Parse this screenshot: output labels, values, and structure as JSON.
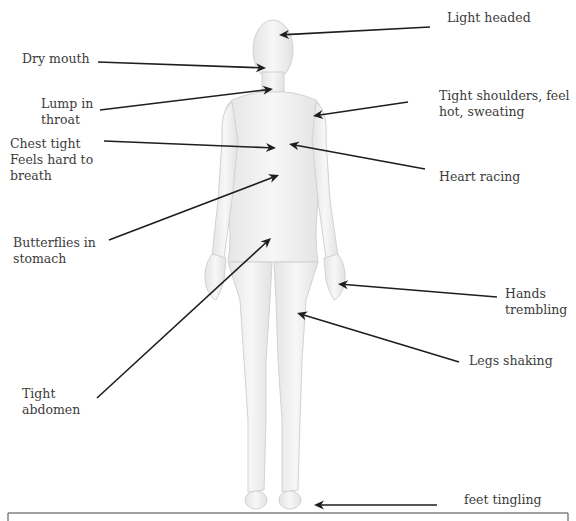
{
  "diagram": {
    "colors": {
      "arrow": "#1e1e1e",
      "text": "#3c3c3c",
      "body_fill": "#efefef",
      "body_stroke": "#cfcfcf",
      "frame": "#444444"
    },
    "labels": [
      {
        "id": "light-headed",
        "text": "Light headed",
        "x": 447,
        "y": 10
      },
      {
        "id": "dry-mouth",
        "text": "Dry mouth",
        "x": 22,
        "y": 51
      },
      {
        "id": "lump-in-throat",
        "text": "Lump in\nthroat",
        "x": 41,
        "y": 96
      },
      {
        "id": "tight-shoulders",
        "text": "Tight shoulders, feel\nhot, sweating",
        "x": 439,
        "y": 88
      },
      {
        "id": "chest-tight",
        "text": "Chest tight\nFeels hard to\nbreath",
        "x": 10,
        "y": 136
      },
      {
        "id": "heart-racing",
        "text": "Heart racing",
        "x": 439,
        "y": 169
      },
      {
        "id": "butterflies",
        "text": "Butterflies in\nstomach",
        "x": 13,
        "y": 235
      },
      {
        "id": "hands-trembling",
        "text": "Hands\ntrembling",
        "x": 505,
        "y": 286
      },
      {
        "id": "legs-shaking",
        "text": "Legs shaking",
        "x": 469,
        "y": 353
      },
      {
        "id": "tight-abdomen",
        "text": "Tight\nabdomen",
        "x": 22,
        "y": 386
      },
      {
        "id": "feet-tingling",
        "text": "feet tingling",
        "x": 464,
        "y": 492
      }
    ],
    "arrows": [
      {
        "id": "light-headed",
        "x1": 430,
        "y1": 27,
        "x2": 279,
        "y2": 35
      },
      {
        "id": "dry-mouth",
        "x1": 98,
        "y1": 62,
        "x2": 266,
        "y2": 68
      },
      {
        "id": "lump-in-throat",
        "x1": 100,
        "y1": 110,
        "x2": 273,
        "y2": 89
      },
      {
        "id": "tight-shoulders",
        "x1": 408,
        "y1": 102,
        "x2": 313,
        "y2": 116
      },
      {
        "id": "chest-tight",
        "x1": 104,
        "y1": 141,
        "x2": 276,
        "y2": 148
      },
      {
        "id": "heart-racing",
        "x1": 425,
        "y1": 169,
        "x2": 289,
        "y2": 144
      },
      {
        "id": "butterflies",
        "x1": 109,
        "y1": 240,
        "x2": 279,
        "y2": 175
      },
      {
        "id": "tight-abdomen",
        "x1": 97,
        "y1": 398,
        "x2": 271,
        "y2": 238
      },
      {
        "id": "hands-trembling",
        "x1": 497,
        "y1": 297,
        "x2": 338,
        "y2": 284
      },
      {
        "id": "legs-shaking",
        "x1": 459,
        "y1": 362,
        "x2": 297,
        "y2": 313
      },
      {
        "id": "feet-tingling",
        "x1": 437,
        "y1": 505,
        "x2": 314,
        "y2": 505
      }
    ]
  }
}
